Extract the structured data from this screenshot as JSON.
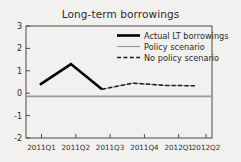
{
  "chart_data": {
    "type": "line",
    "title": "Long-term borrowings",
    "xlabel": "",
    "ylabel": "",
    "categories": [
      "2011Q1",
      "2011Q2",
      "2011Q3",
      "2011Q4",
      "2012Q1",
      "2012Q2"
    ],
    "ylim": [
      -2,
      3
    ],
    "yticks": [
      3,
      2,
      1,
      0,
      -1,
      -2
    ],
    "ytick_labels": [
      "3",
      "2",
      "1",
      "0",
      "-1",
      "-2"
    ],
    "grid": false,
    "zero_line": true,
    "legend_position": "top-right",
    "series": [
      {
        "name": "Actual LT borrowings",
        "style": "solid-thick",
        "color": "#000000",
        "values": [
          0.38,
          1.3,
          0.18,
          null,
          null,
          null
        ]
      },
      {
        "name": "Policy scenario",
        "style": "solid-thin",
        "color": "#9a9a9a",
        "values": [
          0.38,
          1.3,
          0.18,
          0.45,
          0.35,
          0.33
        ]
      },
      {
        "name": "No policy scenario",
        "style": "dashed",
        "color": "#1a1a1a",
        "values": [
          null,
          null,
          0.18,
          0.45,
          0.35,
          0.33
        ]
      }
    ]
  },
  "legend": {
    "items": [
      {
        "label": "Actual LT borrowings"
      },
      {
        "label": "Policy scenario"
      },
      {
        "label": "No policy scenario"
      }
    ]
  },
  "axes": {
    "y_labels": [
      "3",
      "2",
      "1",
      "0",
      "-1",
      "-2"
    ],
    "x_labels": [
      "2011Q1",
      "2011Q2",
      "2011Q3",
      "2011Q4",
      "2012Q1",
      "2012Q2"
    ]
  },
  "colors": {
    "background": "#f2f1ef",
    "axis": "#4a4a4a",
    "zero_line": "#9a9a9a",
    "actual": "#000000",
    "policy": "#9a9a9a",
    "no_policy": "#1a1a1a"
  }
}
